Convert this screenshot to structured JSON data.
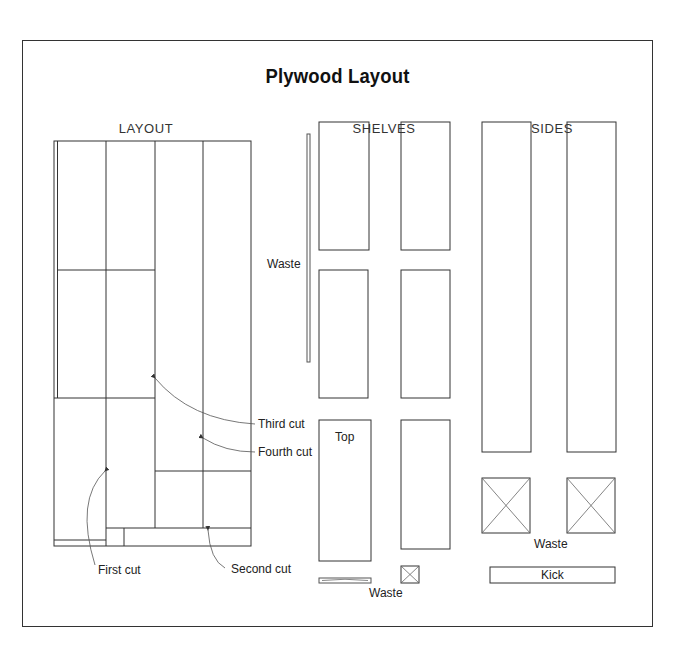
{
  "title": "Plywood Layout",
  "sections": {
    "layout": "LAYOUT",
    "shelves": "SHELVES",
    "sides": "SIDES"
  },
  "layout_callouts": {
    "first_cut": "First cut",
    "second_cut": "Second cut",
    "third_cut": "Third cut",
    "fourth_cut": "Fourth cut"
  },
  "shelves_labels": {
    "waste_strip": "Waste",
    "top": "Top",
    "waste_bottom": "Waste"
  },
  "sides_labels": {
    "waste": "Waste",
    "kick": "Kick"
  },
  "colors": {
    "line": "#333333",
    "thin_line": "#555555",
    "background": "#ffffff"
  }
}
